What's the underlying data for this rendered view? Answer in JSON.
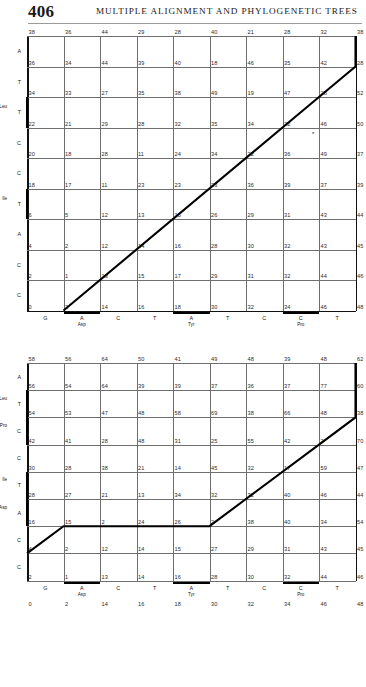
{
  "page": {
    "folio": "406",
    "running_head": "MULTIPLE ALIGNMENT AND PHYLOGENETIC TREES"
  },
  "figures": [
    {
      "id": "top-matrix",
      "marker": "*",
      "columns": [
        {
          "base": "G",
          "sub": ""
        },
        {
          "base": "A",
          "sub": "Asp"
        },
        {
          "base": "C",
          "sub": ""
        },
        {
          "base": "T",
          "sub": ""
        },
        {
          "base": "A",
          "sub": "Tyr"
        },
        {
          "base": "T",
          "sub": ""
        },
        {
          "base": "C",
          "sub": ""
        },
        {
          "base": "C",
          "sub": "Pro"
        },
        {
          "base": "T",
          "sub": ""
        }
      ],
      "rows": [
        {
          "base": "A",
          "sub": ""
        },
        {
          "base": "T",
          "sub": ""
        },
        {
          "base": "T",
          "sub": "Leu"
        },
        {
          "base": "C",
          "sub": ""
        },
        {
          "base": "C",
          "sub": ""
        },
        {
          "base": "T",
          "sub": "Ile"
        },
        {
          "base": "A",
          "sub": ""
        },
        {
          "base": "C",
          "sub": ""
        },
        {
          "base": "C",
          "sub": ""
        }
      ],
      "values": [
        [
          38,
          36,
          44,
          29,
          28,
          40,
          21,
          28,
          32,
          38
        ],
        [
          36,
          34,
          44,
          39,
          40,
          18,
          46,
          35,
          42,
          28
        ],
        [
          34,
          33,
          27,
          35,
          38,
          49,
          19,
          47,
          28,
          52
        ],
        [
          22,
          21,
          29,
          28,
          32,
          35,
          34,
          22,
          46,
          50
        ],
        [
          20,
          18,
          28,
          11,
          24,
          34,
          22,
          36,
          49,
          37
        ],
        [
          18,
          17,
          11,
          23,
          23,
          23,
          36,
          39,
          37,
          39
        ],
        [
          6,
          5,
          12,
          13,
          15,
          26,
          29,
          31,
          43,
          44
        ],
        [
          4,
          2,
          12,
          14,
          16,
          28,
          30,
          32,
          43,
          45
        ],
        [
          2,
          1,
          13,
          15,
          17,
          29,
          31,
          32,
          44,
          46
        ],
        [
          0,
          2,
          14,
          16,
          18,
          30,
          32,
          34,
          46,
          48
        ]
      ]
    },
    {
      "id": "bottom-matrix",
      "marker": "",
      "columns": [
        {
          "base": "G",
          "sub": ""
        },
        {
          "base": "A",
          "sub": "Asp"
        },
        {
          "base": "C",
          "sub": ""
        },
        {
          "base": "T",
          "sub": ""
        },
        {
          "base": "A",
          "sub": "Tyr"
        },
        {
          "base": "T",
          "sub": ""
        },
        {
          "base": "C",
          "sub": ""
        },
        {
          "base": "C",
          "sub": "Pro"
        },
        {
          "base": "T",
          "sub": ""
        }
      ],
      "rows": [
        {
          "base": "A",
          "sub": ""
        },
        {
          "base": "T",
          "sub": "Leu"
        },
        {
          "base": "C",
          "sub": "Pro"
        },
        {
          "base": "C",
          "sub": ""
        },
        {
          "base": "T",
          "sub": "Ile"
        },
        {
          "base": "A",
          "sub": "Asp"
        },
        {
          "base": "C",
          "sub": ""
        },
        {
          "base": "C",
          "sub": ""
        }
      ],
      "values": [
        [
          58,
          56,
          64,
          50,
          41,
          49,
          48,
          39,
          48,
          62
        ],
        [
          56,
          54,
          64,
          39,
          39,
          37,
          36,
          37,
          77,
          60
        ],
        [
          54,
          53,
          47,
          48,
          58,
          69,
          38,
          66,
          48,
          38
        ],
        [
          42,
          41,
          28,
          48,
          31,
          25,
          55,
          42,
          2,
          70
        ],
        [
          30,
          28,
          38,
          21,
          14,
          45,
          32,
          17,
          59,
          47
        ],
        [
          28,
          27,
          21,
          13,
          34,
          32,
          32,
          40,
          46,
          44
        ],
        [
          16,
          15,
          2,
          24,
          26,
          2,
          38,
          40,
          34,
          54
        ],
        [
          4,
          2,
          12,
          14,
          15,
          27,
          29,
          31,
          43,
          45
        ],
        [
          2,
          1,
          13,
          14,
          16,
          28,
          30,
          32,
          44,
          46
        ],
        [
          0,
          2,
          14,
          16,
          18,
          30,
          32,
          34,
          46,
          48
        ]
      ]
    }
  ]
}
